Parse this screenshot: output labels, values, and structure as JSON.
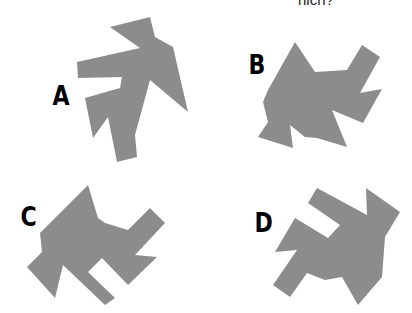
{
  "header": {
    "cropped_text": "hich?"
  },
  "options": [
    {
      "label": "A",
      "color": "#8c8c8c"
    },
    {
      "label": "B",
      "color": "#8c8c8c"
    },
    {
      "label": "C",
      "color": "#8c8c8c"
    },
    {
      "label": "D",
      "color": "#8c8c8c"
    }
  ]
}
